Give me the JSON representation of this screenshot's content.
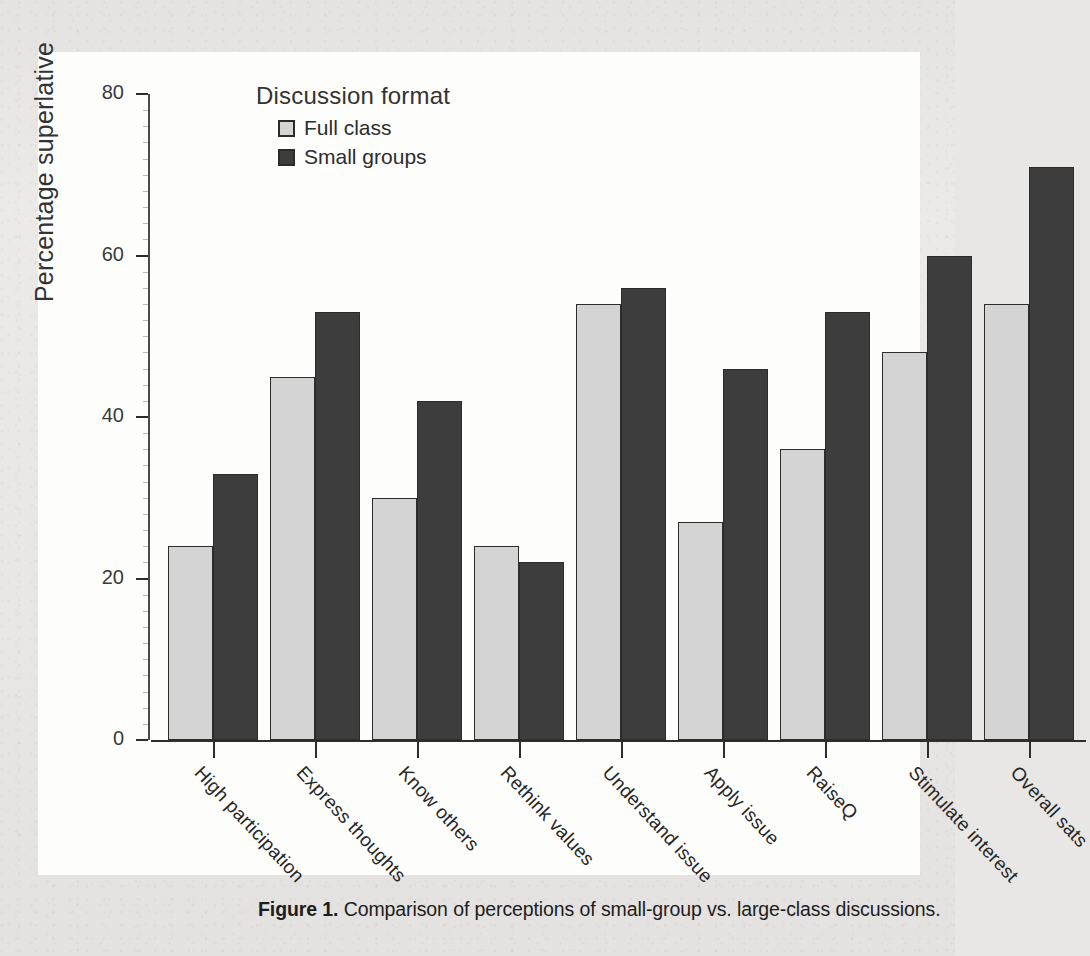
{
  "figure": {
    "caption_label": "Figure 1.",
    "caption_text": " Comparison of perceptions of small-group vs. large-class discussions."
  },
  "legend": {
    "title": "Discussion format",
    "entries": [
      {
        "label": "Full class",
        "color": "#d4d4d4"
      },
      {
        "label": "Small groups",
        "color": "#3d3d3d"
      }
    ]
  },
  "axes": {
    "ylabel": "Percentage superlative",
    "yticks": [
      "0",
      "20",
      "40",
      "60",
      "80"
    ]
  },
  "chart_data": {
    "type": "bar",
    "title": "",
    "xlabel": "",
    "ylabel": "Percentage superlative",
    "ylim": [
      0,
      85
    ],
    "yticks": [
      0,
      20,
      40,
      60,
      80
    ],
    "grid": false,
    "legend_position": "top-left-inside",
    "legend_title": "Discussion format",
    "categories": [
      "High participation",
      "Express thoughts",
      "Know others",
      "Rethink values",
      "Understand issue",
      "Apply issue",
      "RaiseQ",
      "Stimulate interest",
      "Overall sats"
    ],
    "series": [
      {
        "name": "Full class",
        "color": "#d4d4d4",
        "values": [
          24,
          45,
          30,
          24,
          54,
          27,
          36,
          48,
          54
        ]
      },
      {
        "name": "Small groups",
        "color": "#3d3d3d",
        "values": [
          33,
          53,
          42,
          22,
          56,
          46,
          53,
          60,
          71
        ]
      }
    ]
  }
}
